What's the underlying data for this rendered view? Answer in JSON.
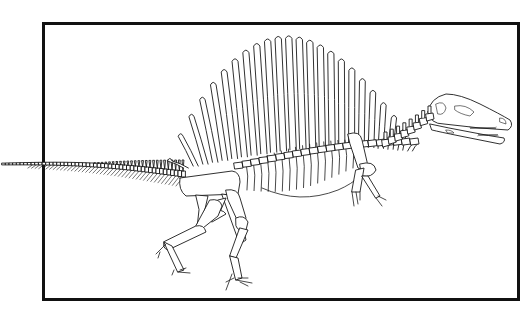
{
  "figure": {
    "style": "black line drawing on white",
    "frame_color": "#111111",
    "line_color": "#1a1a1a",
    "background": "#ffffff",
    "neural_spine_count": 24,
    "caudal_vertebra_count": 50
  }
}
